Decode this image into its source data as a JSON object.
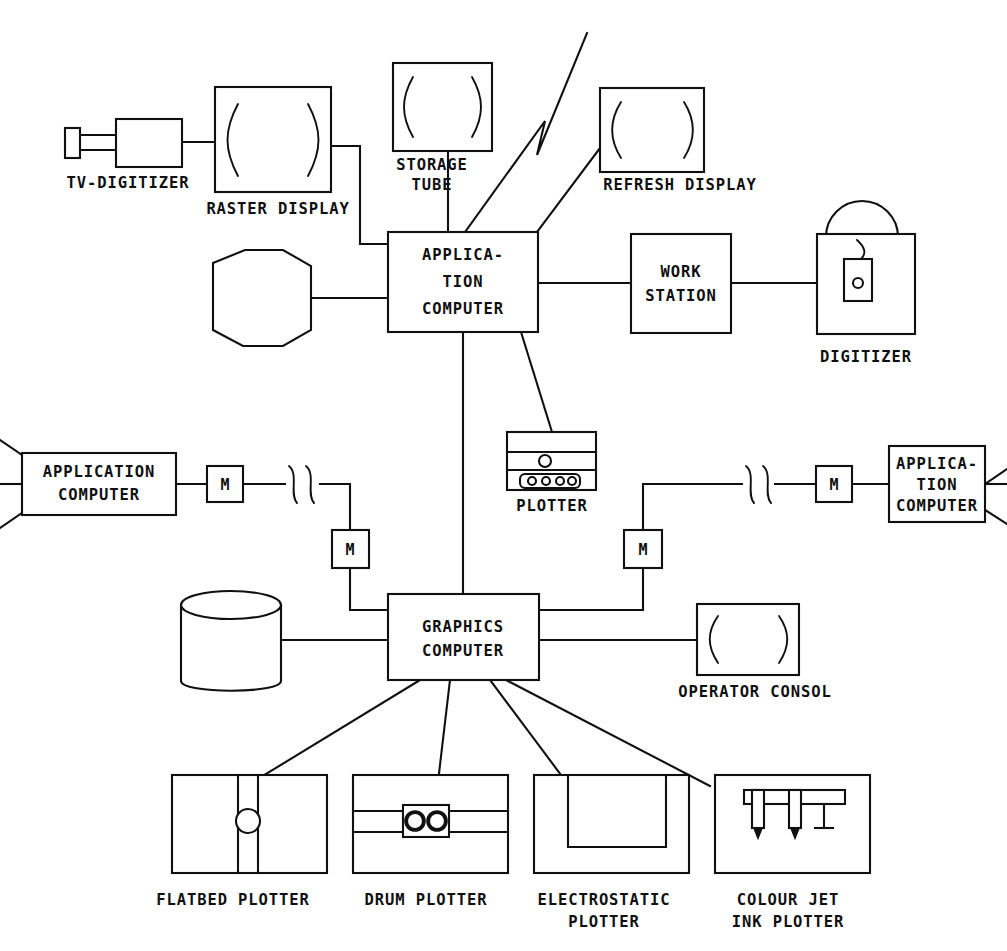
{
  "diagram": {
    "type": "block-diagram",
    "background_color": "#ffffff",
    "line_color": "#101010",
    "nodes": {
      "tv_digitizer": {
        "label": "TV-DIGITIZER",
        "icon": "camera-icon"
      },
      "raster_display": {
        "label": "RASTER DISPLAY",
        "icon": "crt-screen-icon"
      },
      "storage_tube": {
        "label_line1": "STORAGE",
        "label_line2": "TUBE",
        "icon": "crt-screen-icon"
      },
      "refresh_display": {
        "label": "REFRESH DISPLAY",
        "icon": "crt-screen-icon"
      },
      "application_computer_center": {
        "label_line1": "APPLICA-",
        "label_line2": "TION",
        "label_line3": "COMPUTER"
      },
      "work_station": {
        "label_line1": "WORK",
        "label_line2": "STATION"
      },
      "digitizer": {
        "label": "DIGITIZER",
        "icon": "digitizer-tablet-icon"
      },
      "disk_storage_top": {
        "label": "",
        "icon": "disk-storage-icon"
      },
      "plotter_center": {
        "label": "PLOTTER",
        "icon": "plotter-icon"
      },
      "application_computer_left": {
        "label_line1": "APPLICATION",
        "label_line2": "COMPUTER"
      },
      "application_computer_right": {
        "label_line1": "APPLICA-",
        "label_line2": "TION",
        "label_line3": "COMPUTER"
      },
      "modem_left_outer": {
        "label": "M"
      },
      "modem_left_inner": {
        "label": "M"
      },
      "modem_right_outer": {
        "label": "M"
      },
      "modem_right_inner": {
        "label": "M"
      },
      "graphics_computer": {
        "label_line1": "GRAPHICS",
        "label_line2": "COMPUTER"
      },
      "disk_storage_bottom": {
        "label": "",
        "icon": "disk-cylinder-icon"
      },
      "operator_consol": {
        "label": "OPERATOR CONSOL",
        "icon": "crt-screen-icon"
      },
      "flatbed_plotter": {
        "label": "FLATBED PLOTTER",
        "icon": "flatbed-plotter-icon"
      },
      "drum_plotter": {
        "label": "DRUM PLOTTER",
        "icon": "drum-plotter-icon"
      },
      "electrostatic_plotter": {
        "label_line1": "ELECTROSTATIC",
        "label_line2": "PLOTTER",
        "icon": "electrostatic-plotter-icon"
      },
      "colour_jet_ink_plotter": {
        "label_line1": "COLOUR JET",
        "label_line2": "INK PLOTTER",
        "icon": "ink-jet-plotter-icon"
      }
    }
  }
}
